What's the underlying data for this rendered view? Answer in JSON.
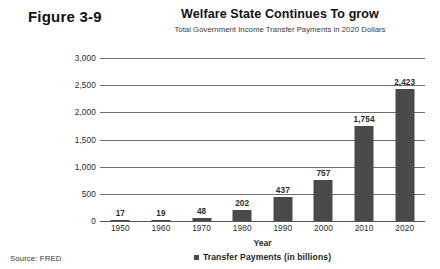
{
  "figure": {
    "label": "Figure 3-9",
    "source_note": "Source: FRED"
  },
  "chart_data": {
    "type": "bar",
    "title": "Welfare State Continues To grow",
    "subtitle": "Total Government Income Transfer Payments in 2020 Dollars",
    "xlabel": "Year",
    "ylabel": "",
    "categories": [
      "1950",
      "1960",
      "1970",
      "1980",
      "1990",
      "2000",
      "2010",
      "2020"
    ],
    "values": [
      17,
      19,
      48,
      202,
      437,
      757,
      1754,
      2423
    ],
    "value_labels": [
      "17",
      "19",
      "48",
      "202",
      "437",
      "757",
      "1,754",
      "2,423"
    ],
    "series": [
      {
        "name": "Transfer Payments (in billions)",
        "values": [
          17,
          19,
          48,
          202,
          437,
          757,
          1754,
          2423
        ],
        "color": "#4a4a4a"
      }
    ],
    "ylim": [
      0,
      3000
    ],
    "yticks": [
      0,
      500,
      1000,
      1500,
      2000,
      2500,
      3000
    ],
    "ytick_labels": [
      "0",
      "500",
      "1,000",
      "1,500",
      "2,000",
      "2,500",
      "3,000"
    ],
    "grid": true,
    "legend_position": "bottom",
    "legend_entries": [
      "Transfer Payments (in billions)"
    ]
  }
}
